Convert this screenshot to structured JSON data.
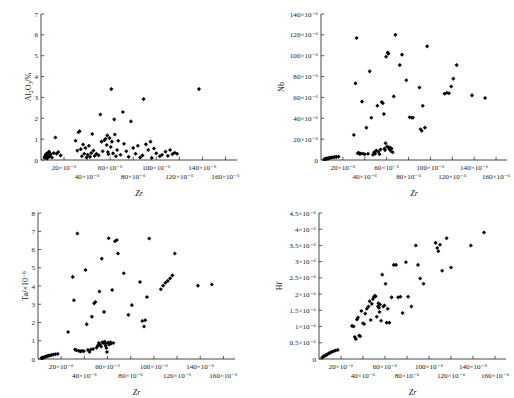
{
  "figure": {
    "background": "#ffffff",
    "marker_color": "#000000",
    "axis_color": "#1a1a1a",
    "shared_xlabel": "Zr",
    "x_tick_labels": [
      "20×10⁻⁶",
      "40×10⁻⁶",
      "60×10⁻⁶",
      "80×10⁻⁶",
      "100×10⁻⁶",
      "120×10⁻⁶",
      "140×10⁻⁶",
      "160×10⁻⁶"
    ],
    "x_tick_values": [
      20,
      40,
      60,
      80,
      100,
      120,
      140,
      160
    ],
    "x_range": [
      0,
      170
    ]
  },
  "chart_data": [
    {
      "type": "scatter",
      "panel": "top-left",
      "title": "",
      "xlabel": "Zr",
      "ylabel": "Al₂O₃/%",
      "ylabel_parts": {
        "base": "Al",
        "sub1": "2",
        "mid": "O",
        "sub2": "3",
        "tail": "/%"
      },
      "xlim": [
        0,
        170
      ],
      "ylim": [
        0,
        7
      ],
      "y_ticks": [
        0,
        1,
        2,
        3,
        4,
        5,
        6,
        7
      ],
      "y_tick_labels": [
        "0",
        "1",
        "2",
        "3",
        "4",
        "5",
        "6",
        "7"
      ],
      "grid": false,
      "legend": "none",
      "points": [
        [
          3.0,
          0.12
        ],
        [
          3.4,
          0.18
        ],
        [
          3.8,
          0.1
        ],
        [
          4.2,
          0.25
        ],
        [
          4.6,
          0.3
        ],
        [
          5.0,
          0.15
        ],
        [
          5.4,
          0.08
        ],
        [
          5.8,
          0.22
        ],
        [
          6.2,
          0.35
        ],
        [
          6.6,
          0.14
        ],
        [
          7.0,
          0.4
        ],
        [
          7.6,
          0.2
        ],
        [
          8.4,
          0.28
        ],
        [
          9.5,
          0.12
        ],
        [
          11.0,
          0.33
        ],
        [
          12.5,
          1.08
        ],
        [
          13.5,
          0.3
        ],
        [
          15.0,
          0.38
        ],
        [
          17.0,
          0.22
        ],
        [
          30.0,
          0.92
        ],
        [
          31.5,
          0.45
        ],
        [
          32.5,
          1.33
        ],
        [
          33.5,
          1.38
        ],
        [
          34.5,
          0.52
        ],
        [
          35.5,
          0.18
        ],
        [
          36.5,
          0.74
        ],
        [
          37.5,
          0.3
        ],
        [
          38.5,
          0.58
        ],
        [
          39.5,
          0.12
        ],
        [
          40.5,
          0.25
        ],
        [
          41.5,
          0.68
        ],
        [
          42.5,
          0.15
        ],
        [
          43.5,
          0.33
        ],
        [
          44.5,
          1.25
        ],
        [
          45.5,
          0.45
        ],
        [
          46.5,
          0.2
        ],
        [
          48.0,
          0.3
        ],
        [
          50.0,
          0.22
        ],
        [
          51.5,
          2.18
        ],
        [
          52.5,
          0.88
        ],
        [
          53.5,
          0.42
        ],
        [
          55.0,
          0.95
        ],
        [
          56.0,
          1.02
        ],
        [
          57.0,
          0.72
        ],
        [
          57.5,
          1.18
        ],
        [
          58.0,
          0.38
        ],
        [
          58.5,
          0.28
        ],
        [
          59.5,
          1.05
        ],
        [
          60.5,
          0.62
        ],
        [
          61.0,
          3.4
        ],
        [
          61.5,
          0.88
        ],
        [
          62.5,
          0.32
        ],
        [
          63.5,
          1.95
        ],
        [
          64.0,
          1.22
        ],
        [
          65.0,
          0.18
        ],
        [
          66.0,
          0.48
        ],
        [
          67.0,
          0.92
        ],
        [
          69.0,
          0.25
        ],
        [
          71.0,
          2.3
        ],
        [
          72.0,
          0.78
        ],
        [
          74.0,
          0.42
        ],
        [
          76.0,
          0.15
        ],
        [
          78.0,
          1.85
        ],
        [
          80.0,
          0.58
        ],
        [
          82.0,
          0.3
        ],
        [
          84.0,
          0.68
        ],
        [
          86.0,
          0.12
        ],
        [
          88.0,
          0.22
        ],
        [
          89.0,
          2.92
        ],
        [
          91.0,
          0.75
        ],
        [
          93.0,
          0.48
        ],
        [
          95.0,
          0.88
        ],
        [
          96.0,
          0.1
        ],
        [
          98.0,
          0.55
        ],
        [
          100.0,
          0.32
        ],
        [
          103.0,
          0.18
        ],
        [
          105.0,
          0.25
        ],
        [
          108.0,
          0.4
        ],
        [
          110.0,
          0.2
        ],
        [
          112.0,
          0.48
        ],
        [
          114.0,
          0.28
        ],
        [
          116.0,
          0.35
        ],
        [
          118.0,
          0.3
        ],
        [
          137.0,
          3.4
        ]
      ]
    },
    {
      "type": "scatter",
      "panel": "top-right",
      "title": "",
      "xlabel": "Zr",
      "ylabel": "Nb",
      "ylim_raw": [
        0,
        140
      ],
      "unit_exponent": "×10⁻⁶",
      "xlim": [
        0,
        170
      ],
      "y_ticks": [
        0,
        20,
        40,
        60,
        80,
        100,
        120,
        140
      ],
      "y_tick_labels": [
        "0",
        "20×10⁻⁶",
        "40×10⁻⁶",
        "60×10⁻⁶",
        "80×10⁻⁶",
        "100×10⁻⁶",
        "120×10⁻⁶",
        "140×10⁻⁶"
      ],
      "grid": false,
      "legend": "none",
      "points": [
        [
          3.0,
          0.8
        ],
        [
          3.6,
          1.0
        ],
        [
          4.2,
          0.9
        ],
        [
          4.8,
          1.4
        ],
        [
          5.4,
          1.2
        ],
        [
          6.0,
          1.6
        ],
        [
          6.8,
          1.5
        ],
        [
          7.6,
          2.0
        ],
        [
          8.6,
          2.2
        ],
        [
          9.6,
          2.4
        ],
        [
          11.0,
          2.6
        ],
        [
          12.4,
          2.8
        ],
        [
          14.0,
          3.0
        ],
        [
          16.0,
          3.2
        ],
        [
          30.0,
          24.0
        ],
        [
          31.5,
          73.5
        ],
        [
          32.5,
          117.0
        ],
        [
          33.5,
          6.5
        ],
        [
          34.5,
          7.0
        ],
        [
          35.5,
          5.8
        ],
        [
          36.5,
          6.2
        ],
        [
          37.5,
          56.0
        ],
        [
          38.5,
          6.0
        ],
        [
          40.0,
          5.5
        ],
        [
          41.5,
          31.0
        ],
        [
          43.0,
          6.0
        ],
        [
          44.5,
          85.0
        ],
        [
          46.0,
          40.5
        ],
        [
          47.5,
          5.0
        ],
        [
          48.5,
          7.5
        ],
        [
          49.5,
          6.0
        ],
        [
          50.5,
          9.0
        ],
        [
          51.5,
          52.0
        ],
        [
          52.5,
          8.0
        ],
        [
          53.5,
          5.5
        ],
        [
          54.5,
          10.0
        ],
        [
          55.5,
          55.5
        ],
        [
          56.5,
          54.5
        ],
        [
          57.5,
          44.0
        ],
        [
          58.0,
          11.0
        ],
        [
          58.5,
          9.5
        ],
        [
          59.0,
          16.0
        ],
        [
          59.5,
          99.0
        ],
        [
          60.5,
          13.0
        ],
        [
          61.0,
          103.0
        ],
        [
          61.5,
          102.0
        ],
        [
          62.0,
          11.5
        ],
        [
          62.5,
          10.5
        ],
        [
          63.0,
          12.0
        ],
        [
          63.5,
          9.0
        ],
        [
          64.5,
          11.0
        ],
        [
          65.5,
          7.5
        ],
        [
          66.5,
          61.0
        ],
        [
          68.0,
          120.0
        ],
        [
          72.0,
          91.0
        ],
        [
          74.0,
          101.0
        ],
        [
          78.0,
          76.5
        ],
        [
          81.0,
          41.0
        ],
        [
          83.0,
          40.5
        ],
        [
          84.0,
          40.5
        ],
        [
          90.0,
          69.5
        ],
        [
          91.0,
          29.5
        ],
        [
          92.0,
          28.0
        ],
        [
          93.0,
          52.0
        ],
        [
          95.0,
          31.0
        ],
        [
          97.0,
          109.0
        ],
        [
          113.0,
          63.5
        ],
        [
          115.0,
          64.5
        ],
        [
          117.0,
          64.0
        ],
        [
          119.0,
          70.5
        ],
        [
          121.0,
          78.0
        ],
        [
          124.0,
          91.0
        ],
        [
          138.0,
          62.0
        ],
        [
          150.0,
          59.5
        ]
      ]
    },
    {
      "type": "scatter",
      "panel": "bottom-left",
      "title": "",
      "xlabel": "Zr",
      "ylabel": "Ta/×10⁻⁶",
      "xlim": [
        0,
        170
      ],
      "ylim": [
        0,
        8
      ],
      "y_ticks": [
        0,
        1,
        2,
        3,
        4,
        5,
        6,
        7,
        8
      ],
      "y_tick_labels": [
        "0",
        "1",
        "2",
        "3",
        "4",
        "5",
        "6",
        "7",
        "8"
      ],
      "grid": false,
      "legend": "none",
      "points": [
        [
          3.0,
          0.05
        ],
        [
          3.6,
          0.06
        ],
        [
          4.2,
          0.08
        ],
        [
          4.8,
          0.07
        ],
        [
          5.4,
          0.1
        ],
        [
          6.2,
          0.12
        ],
        [
          7.0,
          0.14
        ],
        [
          8.0,
          0.16
        ],
        [
          9.2,
          0.18
        ],
        [
          10.4,
          0.2
        ],
        [
          11.8,
          0.22
        ],
        [
          13.2,
          0.24
        ],
        [
          15.0,
          0.26
        ],
        [
          17.0,
          0.28
        ],
        [
          26.0,
          1.48
        ],
        [
          30.0,
          4.5
        ],
        [
          31.0,
          3.22
        ],
        [
          32.0,
          0.52
        ],
        [
          33.0,
          0.48
        ],
        [
          34.0,
          6.88
        ],
        [
          35.0,
          0.45
        ],
        [
          36.5,
          0.42
        ],
        [
          38.0,
          0.44
        ],
        [
          39.5,
          0.43
        ],
        [
          41.0,
          4.88
        ],
        [
          42.0,
          1.9
        ],
        [
          43.0,
          0.5
        ],
        [
          44.5,
          0.38
        ],
        [
          45.5,
          0.52
        ],
        [
          46.5,
          2.32
        ],
        [
          47.5,
          0.55
        ],
        [
          48.5,
          3.05
        ],
        [
          49.5,
          3.12
        ],
        [
          50.5,
          0.62
        ],
        [
          51.5,
          0.72
        ],
        [
          52.5,
          0.88
        ],
        [
          53.0,
          3.7
        ],
        [
          53.5,
          0.78
        ],
        [
          54.5,
          0.68
        ],
        [
          55.0,
          5.5
        ],
        [
          55.5,
          0.92
        ],
        [
          56.5,
          0.88
        ],
        [
          57.0,
          2.58
        ],
        [
          57.5,
          0.95
        ],
        [
          58.0,
          0.85
        ],
        [
          58.5,
          0.72
        ],
        [
          59.0,
          0.6
        ],
        [
          59.5,
          0.38
        ],
        [
          60.5,
          0.9
        ],
        [
          61.0,
          6.62
        ],
        [
          61.5,
          0.8
        ],
        [
          62.5,
          0.92
        ],
        [
          63.0,
          0.85
        ],
        [
          64.0,
          3.78
        ],
        [
          65.0,
          0.88
        ],
        [
          66.5,
          6.45
        ],
        [
          68.0,
          6.52
        ],
        [
          69.0,
          5.78
        ],
        [
          74.0,
          4.7
        ],
        [
          78.0,
          2.42
        ],
        [
          81.0,
          2.95
        ],
        [
          88.0,
          4.22
        ],
        [
          90.0,
          2.08
        ],
        [
          91.5,
          1.78
        ],
        [
          92.5,
          2.12
        ],
        [
          94.0,
          3.4
        ],
        [
          96.0,
          6.6
        ],
        [
          106.0,
          3.82
        ],
        [
          108.0,
          4.02
        ],
        [
          110.0,
          4.18
        ],
        [
          112.0,
          4.28
        ],
        [
          114.0,
          4.42
        ],
        [
          116.0,
          4.58
        ],
        [
          118.0,
          5.78
        ],
        [
          138.0,
          4.02
        ],
        [
          150.0,
          4.08
        ]
      ]
    },
    {
      "type": "scatter",
      "panel": "bottom-right",
      "title": "",
      "xlabel": "Zr",
      "ylabel": "Hf",
      "unit_exponent": "×10⁻⁶",
      "xlim": [
        0,
        170
      ],
      "ylim_raw": [
        0,
        4.5
      ],
      "y_ticks": [
        0,
        0.5,
        1,
        1.5,
        2,
        2.5,
        3,
        3.5,
        4,
        4.5
      ],
      "y_tick_labels": [
        "0",
        "0.5×10⁻⁶",
        "1×10⁻⁶",
        "1.5×10⁻⁶",
        "2×10⁻⁶",
        "2.5×10⁻⁶",
        "3×10⁻⁶",
        "3.5×10⁻⁶",
        "4×10⁻⁶",
        "4.5×10⁻⁶"
      ],
      "grid": false,
      "legend": "none",
      "points": [
        [
          3.0,
          0.05
        ],
        [
          3.8,
          0.07
        ],
        [
          4.6,
          0.09
        ],
        [
          5.4,
          0.1
        ],
        [
          6.4,
          0.12
        ],
        [
          7.4,
          0.14
        ],
        [
          8.6,
          0.17
        ],
        [
          10.0,
          0.19
        ],
        [
          11.6,
          0.22
        ],
        [
          13.2,
          0.24
        ],
        [
          15.0,
          0.26
        ],
        [
          17.0,
          0.28
        ],
        [
          30.0,
          1.02
        ],
        [
          31.5,
          1.0
        ],
        [
          32.5,
          0.68
        ],
        [
          33.5,
          0.62
        ],
        [
          34.5,
          1.22
        ],
        [
          35.5,
          1.28
        ],
        [
          36.5,
          0.72
        ],
        [
          37.5,
          0.7
        ],
        [
          38.5,
          1.48
        ],
        [
          40.0,
          1.1
        ],
        [
          41.0,
          1.08
        ],
        [
          42.0,
          1.4
        ],
        [
          43.5,
          1.55
        ],
        [
          45.0,
          1.62
        ],
        [
          46.0,
          1.78
        ],
        [
          47.0,
          1.2
        ],
        [
          48.0,
          1.7
        ],
        [
          49.0,
          1.85
        ],
        [
          50.0,
          1.92
        ],
        [
          50.8,
          1.95
        ],
        [
          51.5,
          1.93
        ],
        [
          52.5,
          1.3
        ],
        [
          53.5,
          1.62
        ],
        [
          54.0,
          1.72
        ],
        [
          54.5,
          1.58
        ],
        [
          55.0,
          1.45
        ],
        [
          55.5,
          1.68
        ],
        [
          56.5,
          1.18
        ],
        [
          57.5,
          2.6
        ],
        [
          58.5,
          1.62
        ],
        [
          59.5,
          1.65
        ],
        [
          60.5,
          2.32
        ],
        [
          61.5,
          1.12
        ],
        [
          62.5,
          1.55
        ],
        [
          64.0,
          1.12
        ],
        [
          66.0,
          1.9
        ],
        [
          68.0,
          2.9
        ],
        [
          70.0,
          2.9
        ],
        [
          72.0,
          1.9
        ],
        [
          74.0,
          1.92
        ],
        [
          76.0,
          1.42
        ],
        [
          79.0,
          2.98
        ],
        [
          81.0,
          1.92
        ],
        [
          84.0,
          1.62
        ],
        [
          88.0,
          3.5
        ],
        [
          90.0,
          2.9
        ],
        [
          92.0,
          2.48
        ],
        [
          95.0,
          2.32
        ],
        [
          106.0,
          3.58
        ],
        [
          107.5,
          3.42
        ],
        [
          108.5,
          3.32
        ],
        [
          110.0,
          3.52
        ],
        [
          112.0,
          2.72
        ],
        [
          116.0,
          3.72
        ],
        [
          120.0,
          2.82
        ],
        [
          138.0,
          3.5
        ],
        [
          150.0,
          3.9
        ]
      ]
    }
  ]
}
